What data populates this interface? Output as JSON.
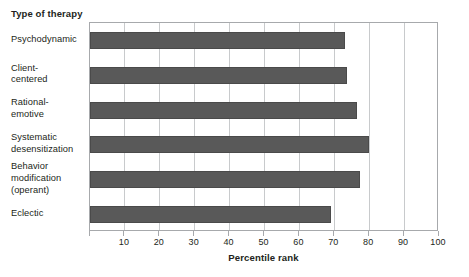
{
  "chart_data": {
    "type": "bar",
    "orientation": "horizontal",
    "title": "",
    "xlabel": "Percentile rank",
    "ylabel": "Type of therapy",
    "xlim": [
      0,
      100
    ],
    "ylim": null,
    "grid": true,
    "legend": null,
    "xticks": [
      0,
      10,
      20,
      30,
      40,
      50,
      60,
      70,
      80,
      90,
      100
    ],
    "xtick_labels": [
      "",
      "10",
      "20",
      "30",
      "40",
      "50",
      "60",
      "70",
      "80",
      "90",
      "100"
    ],
    "categories": [
      "Psychodynamic",
      "Client-centered",
      "Rational-emotive",
      "Systematic desensitization",
      "Behavior modification (operant)",
      "Eclectic"
    ],
    "category_lines": [
      [
        "Psychodynamic"
      ],
      [
        "Client-",
        "centered"
      ],
      [
        "Rational-",
        "emotive"
      ],
      [
        "Systematic",
        "desensitization"
      ],
      [
        "Behavior",
        "modification",
        "(operant)"
      ],
      [
        "Eclectic"
      ]
    ],
    "values": [
      73,
      73.5,
      76.5,
      80,
      77.5,
      69
    ],
    "bar_color": "#595959",
    "bar_edge_color": "#4a4a4a",
    "gridline_color": "#c8cacc",
    "frame_color": "#a7a9ac",
    "text_color": "#231f20"
  }
}
